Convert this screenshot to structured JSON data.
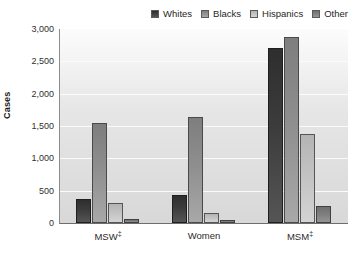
{
  "chart_data": {
    "type": "bar",
    "title": "",
    "subtitle": "",
    "xlabel": "",
    "ylabel": "Cases",
    "categories": [
      "MSW‡",
      "Women",
      "MSM‡"
    ],
    "series": [
      {
        "name": "Whites",
        "values": [
          370,
          430,
          2700
        ],
        "color": "#3c3c3c"
      },
      {
        "name": "Blacks",
        "values": [
          1540,
          1640,
          2880
        ],
        "color": "#8e8e8e"
      },
      {
        "name": "Hispanics",
        "values": [
          310,
          150,
          1380
        ],
        "color": "#c2c2c2"
      },
      {
        "name": "Other",
        "values": [
          60,
          50,
          270
        ],
        "color": "#7d7d7d"
      }
    ],
    "ylim": [
      0,
      3000
    ],
    "yticks": [
      0,
      500,
      1000,
      1500,
      2000,
      2500,
      3000
    ],
    "ytick_labels": [
      "0",
      "500",
      "1,000",
      "1,500",
      "2,000",
      "2,500",
      "3,000"
    ],
    "grid": true,
    "legend_position": "top-right",
    "annotations": []
  },
  "legend": {
    "items": [
      {
        "label": "Whites"
      },
      {
        "label": "Blacks"
      },
      {
        "label": "Hispanics"
      },
      {
        "label": "Other"
      }
    ]
  },
  "axes": {
    "y_title": "Cases"
  }
}
